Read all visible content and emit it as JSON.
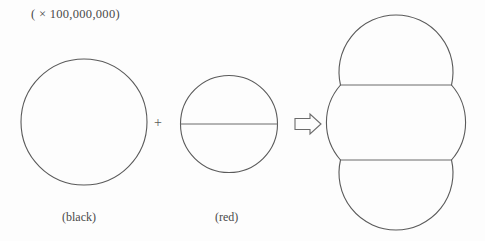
{
  "diagram": {
    "scale_note": "( × 100,000,000)",
    "operator_plus": "+",
    "arrow_icon": "right-arrow-outline-icon",
    "labels": {
      "black": "(black)",
      "red": "(red)"
    },
    "colors": {
      "background": "#fdfdfd",
      "stroke": "#5a5a5a",
      "chord_stroke": "#6a6a6a",
      "text": "#4a4a4a"
    },
    "figures": [
      {
        "id": "figure-black",
        "name": "single-circle",
        "label": "(black)",
        "circle_count": 1,
        "chord_count": 0,
        "center_x": 84,
        "center_y": 122,
        "radius": 63
      },
      {
        "id": "figure-red",
        "name": "double-circle-stack",
        "label": "(red)",
        "circle_count": 2,
        "chord_count": 1,
        "center_x": 229,
        "top_circle_cy": 93,
        "bottom_circle_cy": 155,
        "radius": 46,
        "chord_y": 124
      },
      {
        "id": "figure-result",
        "name": "triple-circle-stack",
        "label": "",
        "circle_count": 3,
        "chord_count": 2,
        "center_x": 396,
        "circle_cys": [
          57,
          122,
          187
        ],
        "radius": 57,
        "chord_ys": [
          85,
          160
        ]
      }
    ]
  }
}
